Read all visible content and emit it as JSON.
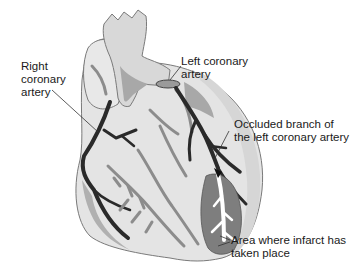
{
  "figure": {
    "labels": {
      "right_coronary": [
        "Right",
        "coronary",
        "artery"
      ],
      "left_coronary": [
        "Left coronary",
        "artery"
      ],
      "occluded_branch": [
        "Occluded branch of",
        "the left coronary artery"
      ],
      "infarct_area": [
        "Area where infarct has",
        "taken place"
      ]
    },
    "colors": {
      "background": "#ffffff",
      "heart_fill": "#e4e4e4",
      "heart_outline": "#7a7a7a",
      "aorta_fill": "#d8d8d8",
      "shadow": "#a8a8a8",
      "artery_dark": "#2a2a2a",
      "artery_mid": "#8c8c8c",
      "infarct": "#7e7e7e",
      "text": "#1a1a1a"
    }
  }
}
